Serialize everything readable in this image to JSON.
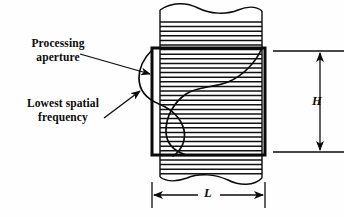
{
  "figure": {
    "type": "technical-diagram",
    "background_color": "#fefefe",
    "line_color": "#0b0b0b"
  },
  "labels": {
    "processing_aperture": "Processing\naperture",
    "lowest_spatial_frequency": "Lowest spatial\nfrequency"
  },
  "dimensions": {
    "height_symbol": "H",
    "length_symbol": "L"
  },
  "geometry": {
    "strip": {
      "left": 160,
      "right": 262,
      "top_break_y": 10,
      "bottom_break_y": 178,
      "hatch_spacing": 4.6,
      "hatch_count": 36
    },
    "aperture_rect": {
      "left": 152,
      "top": 48,
      "right": 265,
      "bottom": 155,
      "stroke_width": 3
    },
    "sine_wave": {
      "periods": 1,
      "axis_x": 213,
      "amplitude": 62,
      "top_y": 48,
      "bottom_y": 155,
      "stroke_width": 1.6
    },
    "h_dimension": {
      "x": 320,
      "y_top": 51,
      "y_bottom": 152,
      "extension_left": 273,
      "extension_right": 344
    },
    "l_dimension": {
      "y": 195,
      "x_left": 152,
      "x_right": 265,
      "extension_top": 178
    },
    "leader_processing": {
      "from_x": 80,
      "from_y": 54,
      "to_x": 154,
      "to_y": 75
    },
    "leader_lowest": {
      "from_x": 104,
      "from_y": 118,
      "to_x": 142,
      "to_y": 90
    }
  }
}
